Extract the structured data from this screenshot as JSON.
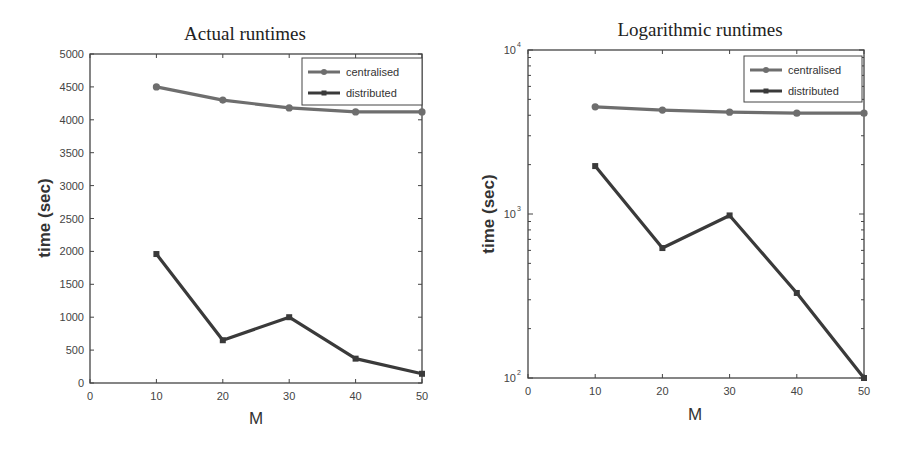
{
  "figure": {
    "background": "#ffffff",
    "panels": [
      {
        "title": "Actual runtimes",
        "xlabel": "M",
        "ylabel": "time (sec)",
        "yscale": "linear",
        "x_ticks": [
          "0",
          "10",
          "20",
          "30",
          "40",
          "50"
        ],
        "y_ticks": [
          "0",
          "500",
          "1000",
          "1500",
          "2000",
          "2500",
          "3000",
          "3500",
          "4000",
          "4500",
          "5000"
        ],
        "legend": [
          "centralised",
          "distributed"
        ]
      },
      {
        "title": "Logarithmic runtimes",
        "xlabel": "M",
        "ylabel": "time (sec)",
        "yscale": "log",
        "x_ticks": [
          "0",
          "10",
          "20",
          "30",
          "40",
          "50"
        ],
        "y_ticks": [
          {
            "base": "10",
            "exp": "2"
          },
          {
            "base": "10",
            "exp": "3"
          },
          {
            "base": "10",
            "exp": "4"
          }
        ],
        "legend": [
          "centralised",
          "distributed"
        ]
      }
    ],
    "colors": {
      "centralised": "#6e6e6e",
      "distributed": "#3a3a3a",
      "axes": "#444444"
    }
  },
  "chart_data": [
    {
      "type": "line",
      "title": "Actual runtimes",
      "xlabel": "M",
      "ylabel": "time (sec)",
      "x": [
        10,
        20,
        30,
        40,
        50
      ],
      "xlim": [
        0,
        50
      ],
      "ylim": [
        0,
        5000
      ],
      "yscale": "linear",
      "grid": false,
      "legend_position": "upper right",
      "series": [
        {
          "name": "centralised",
          "marker": "circle",
          "values": [
            4500,
            4300,
            4180,
            4120,
            4120
          ]
        },
        {
          "name": "distributed",
          "marker": "star",
          "values": [
            1960,
            650,
            1000,
            370,
            140
          ]
        }
      ]
    },
    {
      "type": "line",
      "title": "Logarithmic runtimes",
      "xlabel": "M",
      "ylabel": "time (sec)",
      "x": [
        10,
        20,
        30,
        40,
        50
      ],
      "xlim": [
        0,
        50
      ],
      "ylim": [
        100,
        10000
      ],
      "yscale": "log",
      "grid": false,
      "legend_position": "upper right",
      "series": [
        {
          "name": "centralised",
          "marker": "circle",
          "values": [
            4500,
            4300,
            4180,
            4120,
            4120
          ]
        },
        {
          "name": "distributed",
          "marker": "star",
          "values": [
            1960,
            620,
            980,
            330,
            100
          ]
        }
      ]
    }
  ]
}
